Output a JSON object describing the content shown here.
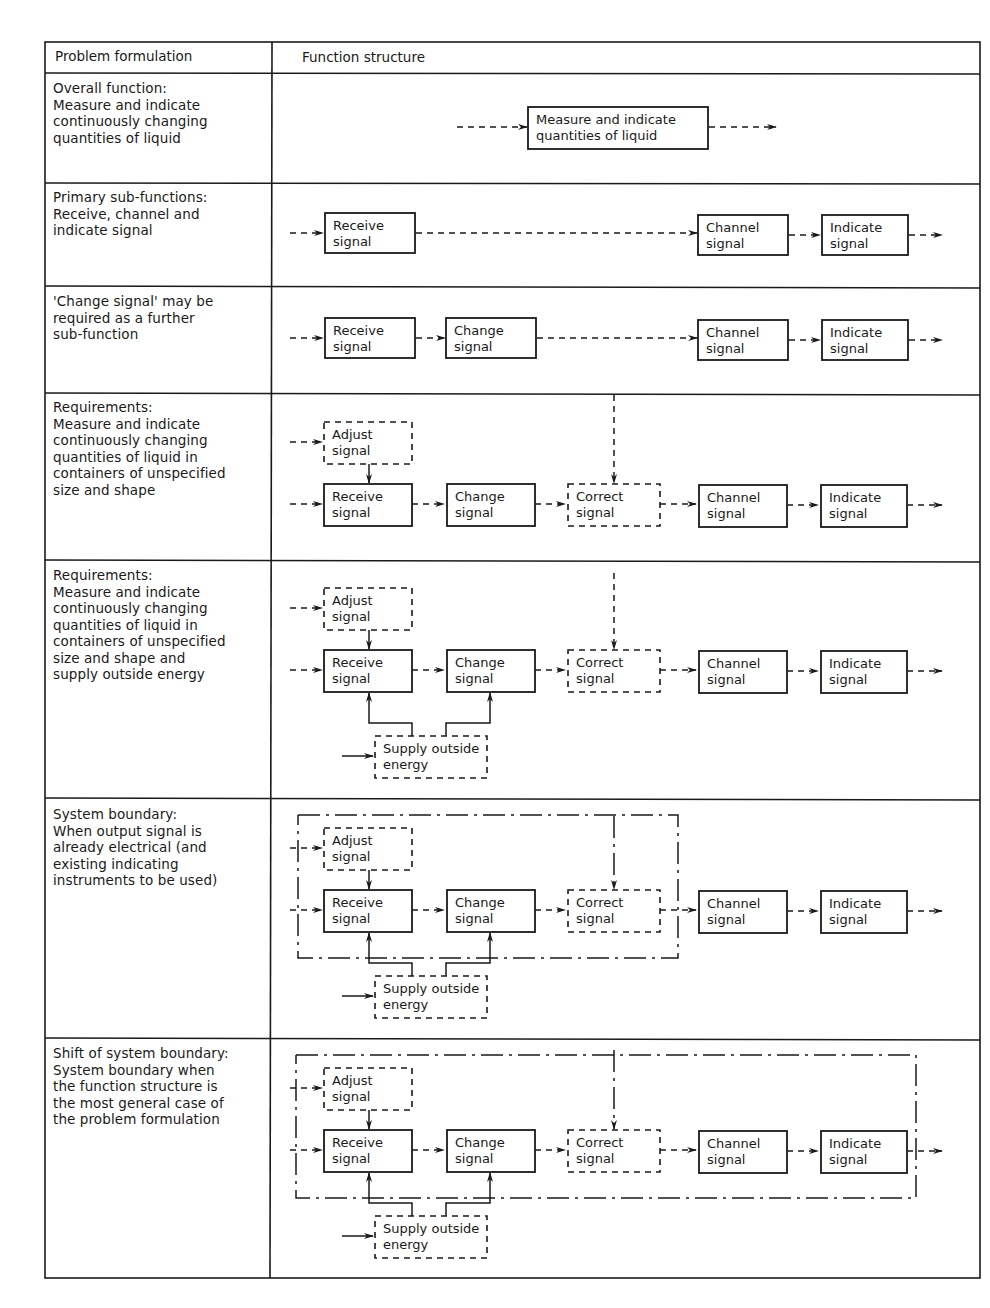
{
  "table": {
    "headers": {
      "problem": "Problem formulation",
      "function": "Function structure"
    },
    "rows": [
      {
        "problem_lines": [
          "Overall function:",
          "Measure and indicate",
          "continuously changing",
          "quantities of liquid"
        ]
      },
      {
        "problem_lines": [
          "Primary sub-functions:",
          "Receive, channel and",
          "indicate signal"
        ]
      },
      {
        "problem_lines": [
          "'Change signal' may be",
          "required as a further",
          "sub-function"
        ]
      },
      {
        "problem_lines": [
          "Requirements:",
          "Measure and indicate",
          "continuously changing",
          "quantities of liquid in",
          "containers of unspecified",
          "size and shape"
        ]
      },
      {
        "problem_lines": [
          "Requirements:",
          "Measure and indicate",
          "continuously changing",
          "quantities of liquid in",
          "containers of unspecified",
          "size and shape and",
          "supply outside energy"
        ]
      },
      {
        "problem_lines": [
          "System boundary:",
          "When output signal is",
          "already electrical (and",
          "existing indicating",
          "instruments to be used)"
        ]
      },
      {
        "problem_lines": [
          "Shift of system boundary:",
          "System boundary when",
          "the function structure is",
          "the most general case of",
          "the problem formulation"
        ]
      }
    ]
  },
  "blocks": {
    "overall": [
      "Measure and indicate",
      "quantities of liquid"
    ],
    "receive": [
      "Receive",
      "signal"
    ],
    "change": [
      "Change",
      "signal"
    ],
    "correct": [
      "Correct",
      "signal"
    ],
    "channel": [
      "Channel",
      "signal"
    ],
    "indicate": [
      "Indicate",
      "signal"
    ],
    "adjust": [
      "Adjust",
      "signal"
    ],
    "supply": [
      "Supply outside",
      "energy"
    ]
  },
  "legend": {
    "solid_box": "required function",
    "dashed_box": "optional / auxiliary function",
    "dash_dot": "system boundary"
  }
}
